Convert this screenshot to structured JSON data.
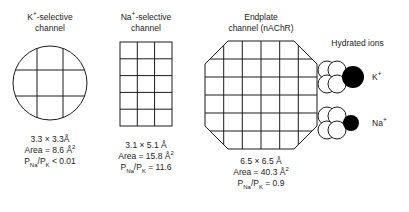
{
  "figure": {
    "background_color": "#ffffff",
    "line_color": "#1a1a1a",
    "ion_fill_color": "#000000"
  },
  "channels": [
    {
      "id": "k-selective",
      "title_line1": "K",
      "title_sup": "+",
      "title_line1_rest": "-selective",
      "title_line2": "channel",
      "shape": "circle",
      "grid_cols": 2,
      "grid_rows": 2,
      "dimensions": "3.3 × 3.3Å",
      "area_label": "Area = 8.6 Å",
      "area_exponent": "2",
      "perm_prefix": "P",
      "perm_sub1": "Na",
      "perm_mid": "/P",
      "perm_sub2": "K",
      "perm_value": " < 0.01"
    },
    {
      "id": "na-selective",
      "title_line1": "Na",
      "title_sup": "+",
      "title_line1_rest": "-selective",
      "title_line2": "channel",
      "shape": "rectangle",
      "grid_cols": 3,
      "grid_rows": 5,
      "dimensions": "3.1 × 5.1 Å",
      "area_label": "Area = 15.8 Å",
      "area_exponent": "2",
      "perm_prefix": "P",
      "perm_sub1": "Na",
      "perm_mid": "/P",
      "perm_sub2": "K",
      "perm_value": " = 11.6"
    },
    {
      "id": "endplate",
      "title_line1": "Endplate",
      "title_sup": "",
      "title_line1_rest": "",
      "title_line2": "channel (nAChR)",
      "shape": "octagon",
      "grid_cols": 6,
      "grid_rows": 6,
      "dimensions": "6.5 × 6.5 Å",
      "area_label": "Area = 40.3 Å",
      "area_exponent": "2",
      "perm_prefix": "P",
      "perm_sub1": "Na",
      "perm_mid": "/P",
      "perm_sub2": "K",
      "perm_value": " = 0.9"
    }
  ],
  "hydrated_ions": {
    "title": "Hydrated ions",
    "items": [
      {
        "id": "k-ion",
        "label": "K",
        "label_sup": "+",
        "water_circles": 4,
        "ion_radius": 11
      },
      {
        "id": "na-ion",
        "label": "Na",
        "label_sup": "+",
        "water_circles": 4,
        "ion_radius": 8
      }
    ]
  }
}
